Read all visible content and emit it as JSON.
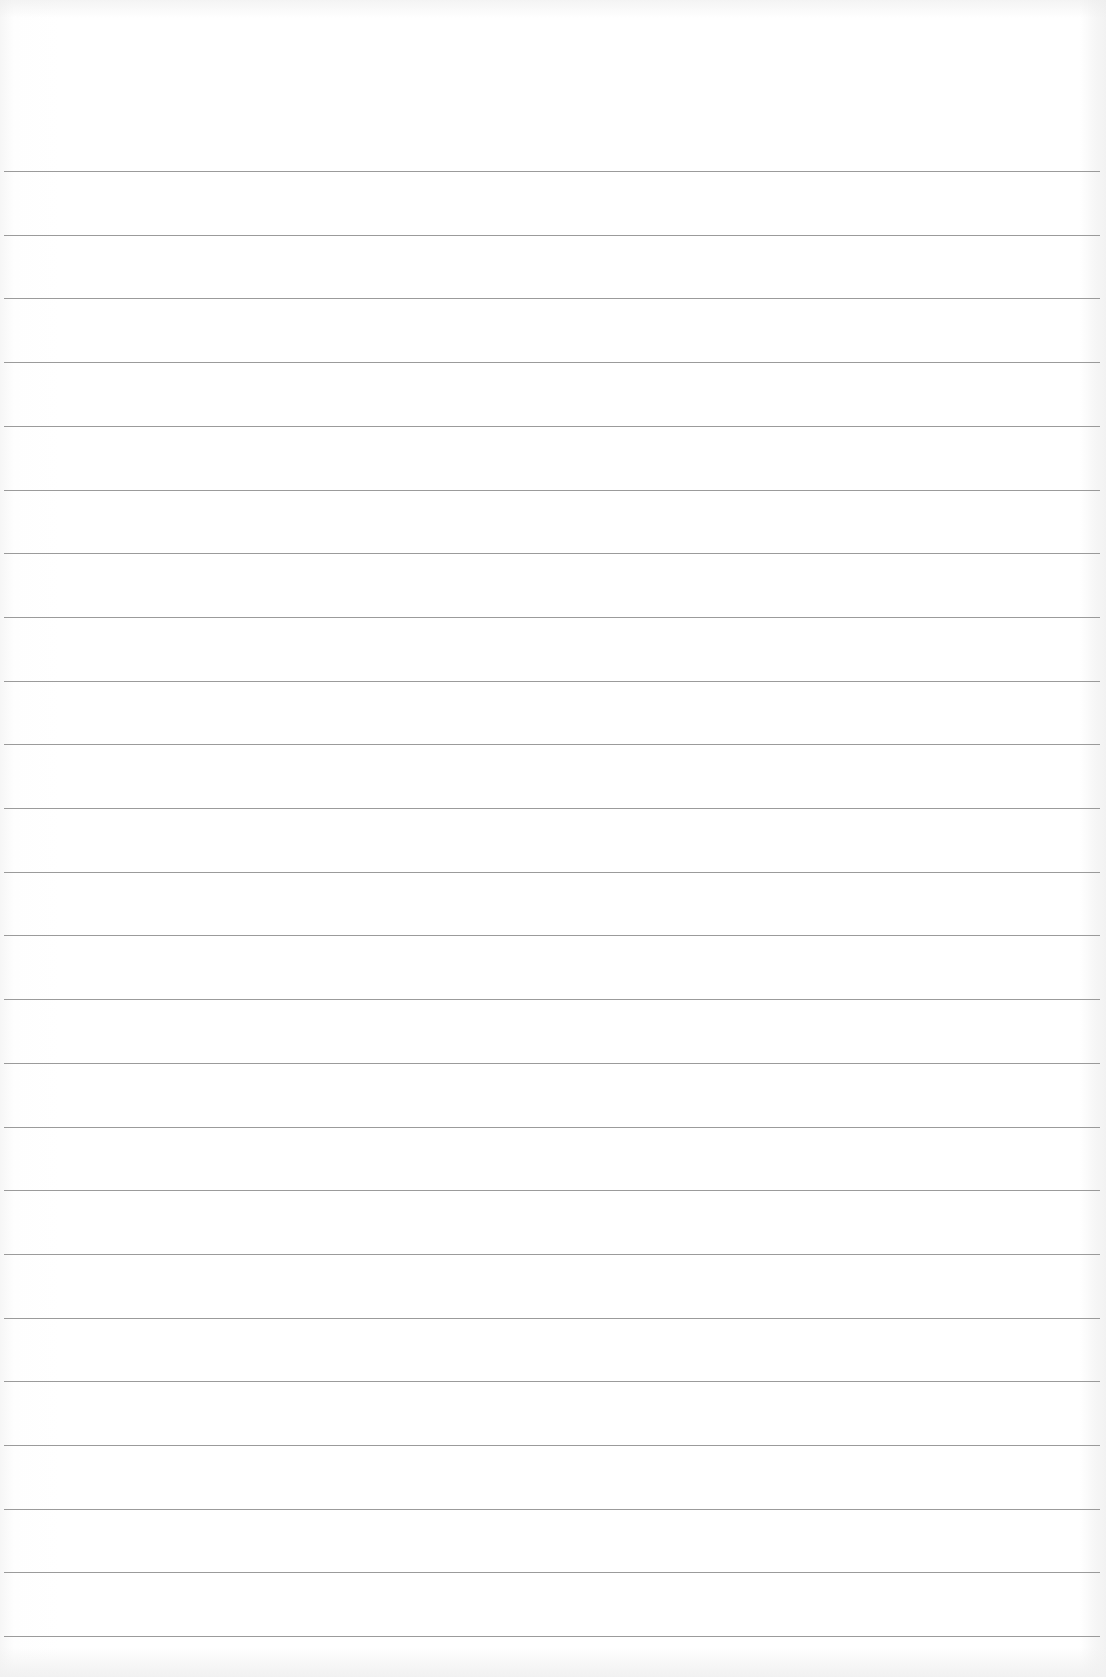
{
  "document": {
    "type": "lined-paper",
    "ruled_lines": {
      "count": 24,
      "first_y": 171,
      "spacing": 63.7,
      "color": "#8a8a8a"
    },
    "text_content": []
  }
}
